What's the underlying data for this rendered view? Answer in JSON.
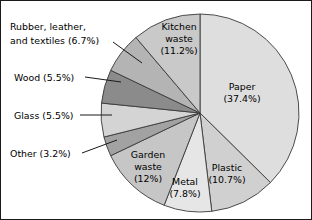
{
  "chart_data": {
    "type": "pie",
    "title": "",
    "subtitle": "",
    "xlabel": "",
    "ylabel": "",
    "legend_position": "none",
    "grid": false,
    "units": "percent",
    "start_angle_deg": 0,
    "direction": "clockwise",
    "categories": [
      "Paper",
      "Plastic",
      "Metal",
      "Garden waste",
      "Other",
      "Glass",
      "Wood",
      "Rubber, leather, and textiles",
      "Kitchen waste"
    ],
    "values": [
      37.4,
      10.7,
      7.8,
      12,
      3.2,
      5.5,
      5.5,
      6.7,
      11.2
    ],
    "colors": [
      "#dedede",
      "#d0d0d0",
      "#e6e6e6",
      "#c6c6c6",
      "#a2a2a2",
      "#d4d4d4",
      "#8b8b8b",
      "#b4b4b4",
      "#c9c9c9"
    ],
    "slices": [
      {
        "name": "Paper",
        "value": 37.4,
        "value_text": "37.4%",
        "label_line1": "Paper",
        "label_line2": "(37.4%)",
        "color": "#dedede",
        "label_placement": "inside"
      },
      {
        "name": "Plastic",
        "value": 10.7,
        "value_text": "10.7%",
        "label_line1": "Plastic",
        "label_line2": "(10.7%)",
        "color": "#d0d0d0",
        "label_placement": "inside"
      },
      {
        "name": "Metal",
        "value": 7.8,
        "value_text": "7.8%",
        "label_line1": "Metal",
        "label_line2": "(7.8%)",
        "color": "#e6e6e6",
        "label_placement": "inside"
      },
      {
        "name": "Garden waste",
        "value": 12,
        "value_text": "12%",
        "label_line1": "Garden",
        "label_line2": "waste",
        "label_line3": "(12%)",
        "color": "#c6c6c6",
        "label_placement": "inside"
      },
      {
        "name": "Other",
        "value": 3.2,
        "value_text": "3.2%",
        "label_line1": "Other (3.2%)",
        "color": "#a2a2a2",
        "label_placement": "outside-left"
      },
      {
        "name": "Glass",
        "value": 5.5,
        "value_text": "5.5%",
        "label_line1": "Glass (5.5%)",
        "color": "#d4d4d4",
        "label_placement": "outside-left"
      },
      {
        "name": "Wood",
        "value": 5.5,
        "value_text": "5.5%",
        "label_line1": "Wood (5.5%)",
        "color": "#8b8b8b",
        "label_placement": "outside-left"
      },
      {
        "name": "Rubber, leather, and textiles",
        "value": 6.7,
        "value_text": "6.7%",
        "label_line1": "Rubber, leather,",
        "label_line2": "and textiles (6.7%)",
        "color": "#b4b4b4",
        "label_placement": "outside-left"
      },
      {
        "name": "Kitchen waste",
        "value": 11.2,
        "value_text": "11.2%",
        "label_line1": "Kitchen",
        "label_line2": "waste",
        "label_line3": "(11.2%)",
        "color": "#c9c9c9",
        "label_placement": "inside"
      }
    ]
  },
  "labels": {
    "paper_l1": "Paper",
    "paper_l2": "(37.4%)",
    "plastic_l1": "Plastic",
    "plastic_l2": "(10.7%)",
    "metal_l1": "Metal",
    "metal_l2": "(7.8%)",
    "garden_l1": "Garden",
    "garden_l2": "waste",
    "garden_l3": "(12%)",
    "kitchen_l1": "Kitchen",
    "kitchen_l2": "waste",
    "kitchen_l3": "(11.2%)",
    "other_l1": "Other (3.2%)",
    "glass_l1": "Glass (5.5%)",
    "wood_l1": "Wood (5.5%)",
    "rubber_l1": "Rubber, leather,",
    "rubber_l2": "and textiles (6.7%)"
  }
}
